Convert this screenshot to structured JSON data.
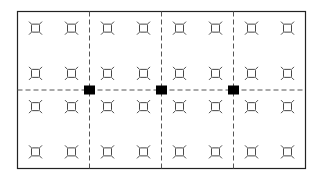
{
  "diagram": {
    "title": "",
    "grid": {
      "columns": 4,
      "rows": 2
    },
    "fixture_layout": {
      "columns_per_cell": 2,
      "rows_per_cell": 2,
      "total_columns": 8,
      "total_rows": 4
    },
    "fixture_icon": "light-fixture-icon",
    "junction_marker_icon": "square-marker-icon",
    "junction_count": 3,
    "colors": {
      "line": "#222222",
      "dashed": "#555555",
      "marker": "#000000",
      "fixture": "#333333",
      "background": "#ffffff"
    }
  }
}
